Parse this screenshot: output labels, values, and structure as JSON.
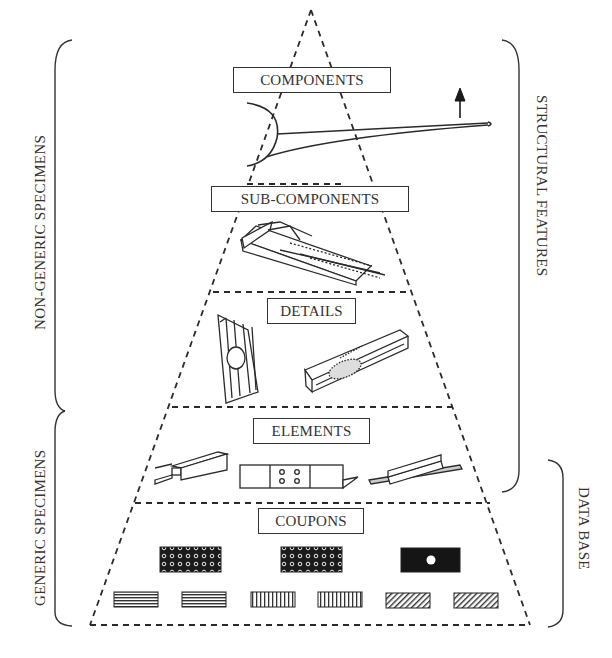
{
  "diagram": {
    "type": "building-block test pyramid",
    "levels": [
      {
        "id": "components",
        "label": "COMPONENTS",
        "illustration": "wing-and-fuselage-with-upward-load-arrow"
      },
      {
        "id": "sub_components",
        "label": "SUB-COMPONENTS",
        "illustration": "stiffened-panel-box-section"
      },
      {
        "id": "details",
        "label": "DETAILS",
        "illustration": [
          "corrugated-panel-with-cutout",
          "channel-beam-with-bonded-patch"
        ]
      },
      {
        "id": "elements",
        "label": "ELEMENTS",
        "illustration": [
          "channel-stiffener",
          "bolted-joint-strip",
          "tee-stiffener"
        ]
      },
      {
        "id": "coupons",
        "label": "COUPONS",
        "illustration": [
          "dotted-laminate-coupon",
          "dotted-laminate-coupon",
          "open-hole-coupon",
          "horizontal-ply-coupon",
          "horizontal-ply-coupon",
          "vertical-ply-coupon",
          "vertical-ply-coupon",
          "diagonal-ply-coupon",
          "diagonal-ply-coupon"
        ]
      }
    ],
    "left_brackets": [
      {
        "label": "NON-GENERIC SPECIMENS",
        "spans": [
          "components",
          "sub_components",
          "details"
        ]
      },
      {
        "label": "GENERIC SPECIMENS",
        "spans": [
          "elements",
          "coupons"
        ]
      }
    ],
    "right_brackets": [
      {
        "label": "STRUCTURAL FEATURES",
        "spans": [
          "components",
          "sub_components",
          "details",
          "elements"
        ]
      },
      {
        "label": "DATA BASE",
        "spans": [
          "elements",
          "coupons"
        ]
      }
    ],
    "colors": {
      "ink": "#2a2a2a",
      "background": "#ffffff"
    }
  }
}
